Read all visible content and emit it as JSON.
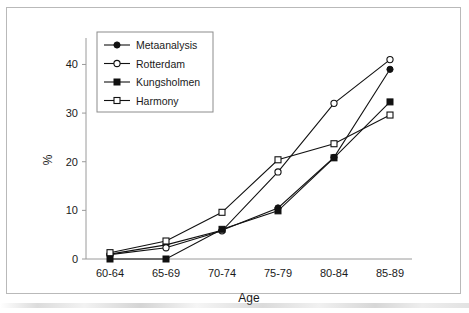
{
  "chart_data": {
    "type": "line",
    "title": "",
    "xlabel": "Age",
    "ylabel": "%",
    "categories": [
      "60-64",
      "65-69",
      "70-74",
      "75-79",
      "80-84",
      "85-89"
    ],
    "yticks": [
      0,
      10,
      20,
      30,
      40
    ],
    "ylim": [
      0,
      44
    ],
    "grid": false,
    "legend_position": "top-left",
    "series": [
      {
        "name": "Metaanalysis",
        "marker": "filled-circle",
        "color": "#111111",
        "values": [
          1.0,
          2.9,
          5.9,
          10.5,
          20.9,
          39.0
        ]
      },
      {
        "name": "Rotterdam",
        "marker": "open-circle",
        "color": "#111111",
        "values": [
          0.9,
          2.3,
          5.8,
          17.9,
          32.0,
          41.0
        ]
      },
      {
        "name": "Kungsholmen",
        "marker": "filled-square",
        "color": "#111111",
        "values": [
          0.0,
          0.0,
          6.1,
          9.9,
          20.8,
          32.3
        ]
      },
      {
        "name": "Harmony",
        "marker": "open-square",
        "color": "#111111",
        "values": [
          1.3,
          3.7,
          9.6,
          20.4,
          23.7,
          29.6
        ]
      }
    ]
  }
}
